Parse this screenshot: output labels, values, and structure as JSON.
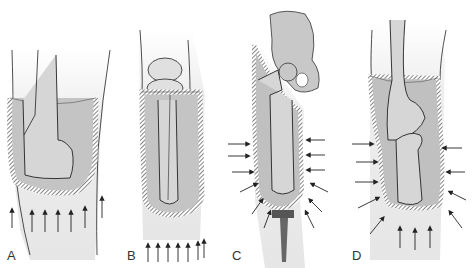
{
  "figure": {
    "panels": [
      {
        "label": "A",
        "description": "Transtibial socket, distal end-bearing, upward pressure arrows"
      },
      {
        "label": "B",
        "description": "Long transtibial socket with knee joint above, upward pressure arrows"
      },
      {
        "label": "C",
        "description": "Transfemoral socket with pelvis, lateral compression arrows and distal pad"
      },
      {
        "label": "D",
        "description": "Knee disarticulation socket, lateral compression and upward arrows"
      }
    ],
    "colors": {
      "skin": "#e8e8e8",
      "socket": "#b8b8b8",
      "bone": "#d4d4d4",
      "outline": "#222222",
      "pad": "#555555"
    }
  }
}
